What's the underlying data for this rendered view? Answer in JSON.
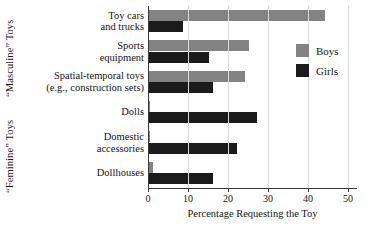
{
  "chart_data": {
    "type": "bar",
    "orientation": "horizontal",
    "title": "",
    "xlabel": "Percentage Requesting the Toy",
    "ylabel": "",
    "xlim": [
      0,
      52
    ],
    "xticks": [
      0,
      10,
      20,
      30,
      40,
      50
    ],
    "grid": true,
    "legend_position": "right",
    "categories": [
      "Toy cars and trucks",
      "Sports equipment",
      "Spatial-temporal toys (e.g., construction sets)",
      "Dolls",
      "Domestic accessories",
      "Dollhouses"
    ],
    "series": [
      {
        "name": "Boys",
        "color": "#838383",
        "values": [
          44,
          25,
          24,
          0.3,
          0.3,
          1
        ]
      },
      {
        "name": "Girls",
        "color": "#1b1b1b",
        "values": [
          8.5,
          15,
          16,
          27,
          22,
          16
        ]
      }
    ]
  },
  "group_labels": {
    "masculine": "“Masculine” Toys",
    "feminine": "“Feminine” Toys"
  },
  "category_lines": [
    {
      "line1": "Toy cars",
      "line2": "and trucks"
    },
    {
      "line1": "Sports",
      "line2": "equipment"
    },
    {
      "line1": "Spatial-temporal toys",
      "line2": "(e.g., construction sets)"
    },
    {
      "line1": "Dolls",
      "line2": ""
    },
    {
      "line1": "Domestic",
      "line2": "accessories"
    },
    {
      "line1": "Dollhouses",
      "line2": ""
    }
  ],
  "axis": {
    "tick_labels": [
      "0",
      "10",
      "20",
      "30",
      "40",
      "50"
    ],
    "x_title": "Percentage Requesting the Toy"
  },
  "legend": {
    "entries": [
      {
        "label": "Boys",
        "color": "#838383"
      },
      {
        "label": "Girls",
        "color": "#1b1b1b"
      }
    ]
  }
}
